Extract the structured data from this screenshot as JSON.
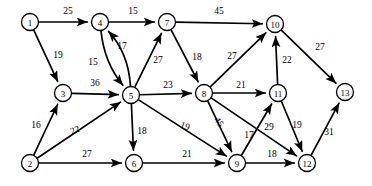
{
  "diagram": {
    "type": "directed-weighted-graph",
    "width": 372,
    "height": 186,
    "background_color": "#ffffff",
    "stroke_color": "#000000",
    "node_radius": 8.5,
    "nodes": [
      {
        "id": "1",
        "label": "1",
        "x": 30,
        "y": 22
      },
      {
        "id": "4",
        "label": "4",
        "x": 100,
        "y": 22
      },
      {
        "id": "7",
        "label": "7",
        "x": 167,
        "y": 22
      },
      {
        "id": "10",
        "label": "10",
        "x": 275,
        "y": 24
      },
      {
        "id": "3",
        "label": "3",
        "x": 63,
        "y": 93
      },
      {
        "id": "5",
        "label": "5",
        "x": 131,
        "y": 95
      },
      {
        "id": "8",
        "label": "8",
        "x": 204,
        "y": 93
      },
      {
        "id": "11",
        "label": "11",
        "x": 278,
        "y": 93
      },
      {
        "id": "13",
        "label": "13",
        "x": 345,
        "y": 92
      },
      {
        "id": "2",
        "label": "2",
        "x": 30,
        "y": 163
      },
      {
        "id": "6",
        "label": "6",
        "x": 134,
        "y": 163
      },
      {
        "id": "9",
        "label": "9",
        "x": 237,
        "y": 163
      },
      {
        "id": "12",
        "label": "12",
        "x": 307,
        "y": 163
      }
    ],
    "edges": [
      {
        "from": "1",
        "to": "4",
        "weight": "25",
        "lx": 68,
        "ly": 11,
        "rot": 0,
        "curve": 0
      },
      {
        "from": "1",
        "to": "3",
        "weight": "19",
        "lx": 58,
        "ly": 55,
        "rot": 0,
        "curve": 0
      },
      {
        "from": "4",
        "to": "7",
        "weight": "15",
        "lx": 133,
        "ly": 11,
        "rot": 0,
        "curve": 0
      },
      {
        "from": "7",
        "to": "10",
        "weight": "45",
        "lx": 219,
        "ly": 11,
        "rot": 0,
        "curve": 0
      },
      {
        "from": "5",
        "to": "4",
        "weight": "15",
        "lx": 93,
        "ly": 62,
        "rot": 0,
        "curve": 14
      },
      {
        "from": "4",
        "to": "5",
        "weight": "17",
        "lx": 122,
        "ly": 46,
        "rot": 0,
        "curve": 12
      },
      {
        "from": "3",
        "to": "5",
        "weight": "36",
        "lx": 95,
        "ly": 83,
        "rot": 0,
        "curve": 0
      },
      {
        "from": "5",
        "to": "7",
        "weight": "27",
        "lx": 158,
        "ly": 60,
        "rot": 0,
        "curve": 0
      },
      {
        "from": "5",
        "to": "8",
        "weight": "23",
        "lx": 168,
        "ly": 85,
        "rot": 0,
        "curve": 0
      },
      {
        "from": "7",
        "to": "8",
        "weight": "18",
        "lx": 197,
        "ly": 57,
        "rot": 0,
        "curve": 0
      },
      {
        "from": "8",
        "to": "10",
        "weight": "27",
        "lx": 232,
        "ly": 56,
        "rot": 0,
        "curve": 0
      },
      {
        "from": "10",
        "to": "13",
        "weight": "27",
        "lx": 320,
        "ly": 47,
        "rot": 0,
        "curve": 0
      },
      {
        "from": "11",
        "to": "10",
        "weight": "22",
        "lx": 287,
        "ly": 60,
        "rot": 0,
        "curve": 0
      },
      {
        "from": "8",
        "to": "11",
        "weight": "21",
        "lx": 241,
        "ly": 85,
        "rot": 0,
        "curve": 0
      },
      {
        "from": "2",
        "to": "3",
        "weight": "16",
        "lx": 36,
        "ly": 125,
        "rot": 0,
        "curve": 0
      },
      {
        "from": "2",
        "to": "5",
        "weight": "22",
        "lx": 75,
        "ly": 130,
        "rot": -22,
        "curve": 0
      },
      {
        "from": "2",
        "to": "6",
        "weight": "27",
        "lx": 87,
        "ly": 154,
        "rot": 0,
        "curve": 0
      },
      {
        "from": "5",
        "to": "6",
        "weight": "18",
        "lx": 142,
        "ly": 131,
        "rot": 0,
        "curve": 0
      },
      {
        "from": "6",
        "to": "9",
        "weight": "21",
        "lx": 187,
        "ly": 154,
        "rot": 0,
        "curve": 0
      },
      {
        "from": "5",
        "to": "9",
        "weight": "19",
        "lx": 185,
        "ly": 126,
        "rot": 22,
        "curve": 0
      },
      {
        "from": "8",
        "to": "9",
        "weight": "45",
        "lx": 219,
        "ly": 122,
        "rot": 55,
        "curve": 0
      },
      {
        "from": "9",
        "to": "11",
        "weight": "17",
        "lx": 249,
        "ly": 135,
        "rot": 0,
        "curve": 0
      },
      {
        "from": "8",
        "to": "12",
        "weight": "29",
        "lx": 269,
        "ly": 127,
        "rot": 0,
        "curve": 0
      },
      {
        "from": "11",
        "to": "12",
        "weight": "19",
        "lx": 297,
        "ly": 125,
        "rot": 0,
        "curve": 0
      },
      {
        "from": "9",
        "to": "12",
        "weight": "18",
        "lx": 272,
        "ly": 154,
        "rot": 0,
        "curve": 0
      },
      {
        "from": "12",
        "to": "13",
        "weight": "31",
        "lx": 329,
        "ly": 132,
        "rot": 0,
        "curve": 0
      }
    ]
  }
}
